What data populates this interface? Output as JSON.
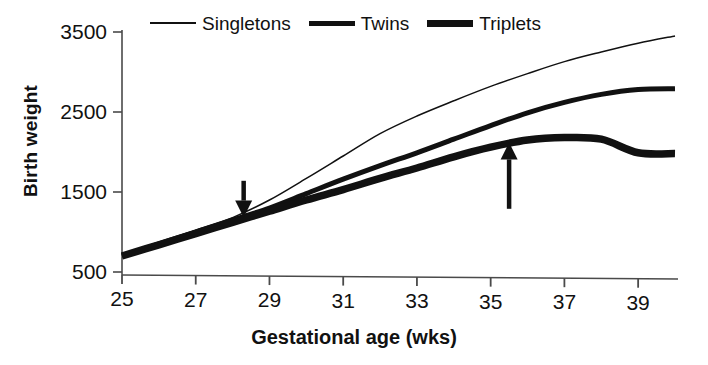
{
  "chart_data": {
    "type": "line",
    "title": "",
    "subtitle": "",
    "xlabel": "Gestational age (wks)",
    "ylabel": "Birth weight",
    "xlim": [
      25,
      40
    ],
    "ylim": [
      500,
      3500
    ],
    "xticks": [
      25,
      27,
      29,
      31,
      33,
      35,
      37,
      39
    ],
    "yticks": [
      500,
      1500,
      2500,
      3500
    ],
    "grid": false,
    "legend_position": "top-center",
    "x": [
      25,
      26,
      27,
      28,
      29,
      30,
      31,
      32,
      33,
      34,
      35,
      36,
      37,
      38,
      39,
      40
    ],
    "series": [
      {
        "name": "Singletons",
        "style": "thin",
        "values": [
          700,
          860,
          1020,
          1180,
          1400,
          1670,
          1950,
          2230,
          2450,
          2640,
          2820,
          2980,
          3130,
          3250,
          3360,
          3450
        ]
      },
      {
        "name": "Twins",
        "style": "medium",
        "values": [
          700,
          850,
          1000,
          1150,
          1300,
          1480,
          1660,
          1830,
          1990,
          2160,
          2330,
          2490,
          2620,
          2720,
          2780,
          2790
        ]
      },
      {
        "name": "Triplets",
        "style": "thick",
        "values": [
          700,
          840,
          980,
          1120,
          1260,
          1400,
          1530,
          1670,
          1800,
          1940,
          2060,
          2150,
          2180,
          2160,
          1990,
          1980
        ]
      }
    ],
    "annotations": [
      {
        "name": "divergence-arrow",
        "direction": "down",
        "x": 28.3,
        "y_tip": 1180,
        "y_tail": 1640,
        "label": ""
      },
      {
        "name": "plateau-arrow",
        "direction": "up",
        "x": 35.5,
        "y_tip": 2120,
        "y_tail": 1290,
        "label": ""
      }
    ]
  },
  "legend": {
    "entries": [
      {
        "label": "Singletons",
        "style": "thin"
      },
      {
        "label": "Twins",
        "style": "medium"
      },
      {
        "label": "Triplets",
        "style": "thick"
      }
    ]
  },
  "axes": {
    "y_title": "Birth weight",
    "x_title": "Gestational age (wks)",
    "y_tick_labels": [
      "3500",
      "2500",
      "1500",
      "500"
    ],
    "x_tick_labels": [
      "25",
      "27",
      "29",
      "31",
      "33",
      "35",
      "37",
      "39"
    ]
  },
  "colors": {
    "ink": "#111111",
    "axis": "#4a4a4a",
    "background": "#ffffff"
  }
}
